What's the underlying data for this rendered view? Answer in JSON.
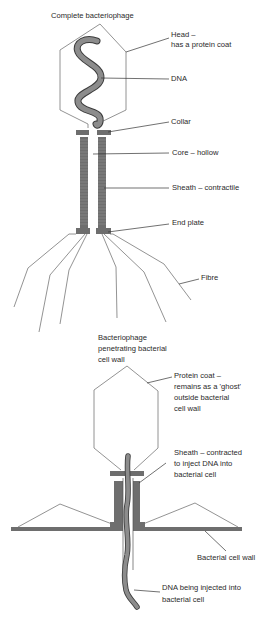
{
  "colors": {
    "outline": "#777777",
    "structure_fill": "#6e6e6e",
    "dna_fill": "#8c8c8c",
    "dna_outline": "#3c3c3c",
    "leader": "#333333",
    "text": "#2a2a2a"
  },
  "top_diagram": {
    "title": "Complete bacteriophage",
    "labels": {
      "head_line1": "Head –",
      "head_line2": "has a protein coat",
      "dna": "DNA",
      "collar": "Collar",
      "core": "Core – hollow",
      "sheath": "Sheath – contractile",
      "end_plate": "End plate",
      "fibre": "Fibre"
    }
  },
  "bottom_diagram": {
    "title_line1": "Bacteriophage",
    "title_line2": "penetrating bacterial",
    "title_line3": "cell wall",
    "labels": {
      "protein_coat_line1": "Protein coat –",
      "protein_coat_line2": "remains as a 'ghost'",
      "protein_coat_line3": "outside bacterial",
      "protein_coat_line4": "cell wall",
      "sheath_line1": "Sheath – contracted",
      "sheath_line2": "to inject DNA into",
      "sheath_line3": "bacterial cell",
      "cell_wall": "Bacterial cell wall",
      "dna_line1": "DNA being injected into",
      "dna_line2": "bacterial cell"
    }
  }
}
